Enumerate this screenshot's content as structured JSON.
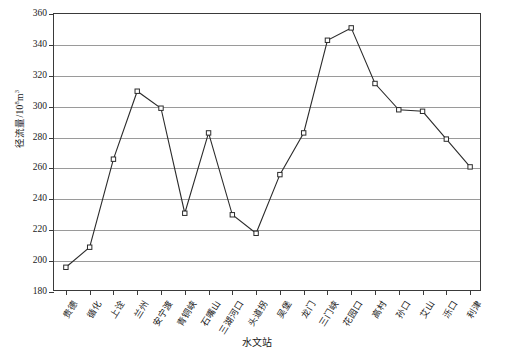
{
  "chart_data": {
    "type": "line",
    "title": "",
    "xlabel": "水文站",
    "ylabel": "径流量/10⁸m³",
    "ylabel_base": "径流量/10",
    "ylabel_exp": "8",
    "ylabel_tail": "m",
    "ylabel_tail_exp": "3",
    "ylim": [
      180,
      360
    ],
    "ytick_step": 20,
    "ytick_labels": [
      "360",
      "340",
      "320",
      "300",
      "280",
      "260",
      "240",
      "220",
      "200",
      "180"
    ],
    "grid": true,
    "legend": "none",
    "marker": "open-square",
    "categories": [
      "贵德",
      "循化",
      "上诠",
      "兰州",
      "安宁渡",
      "青铜峡",
      "石嘴山",
      "三湖河口",
      "头道拐",
      "吴堡",
      "龙门",
      "三门峡",
      "花园口",
      "高村",
      "孙口",
      "艾山",
      "泺口",
      "利津"
    ],
    "values": [
      196,
      209,
      266,
      310,
      299,
      231,
      283,
      230,
      218,
      256,
      283,
      343,
      351,
      315,
      298,
      297,
      279,
      261
    ]
  },
  "colors": {
    "line": "#2b2b2b",
    "marker_fill": "#ffffff",
    "grid": "#9a9a9a",
    "axis": "#3a3a3a",
    "background": "#ffffff"
  }
}
